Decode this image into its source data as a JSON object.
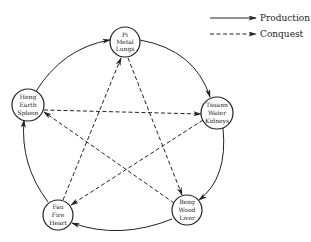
{
  "legend": {
    "production_label": "Production",
    "conquest_label": "Conquest"
  },
  "nodes": [
    {
      "id": "pi",
      "lines": [
        "Pi",
        "Metal",
        "Lungs"
      ],
      "cx": 125,
      "cy": 42
    },
    {
      "id": "tsuann",
      "lines": [
        "Tsuann",
        "Water",
        "Kidneys"
      ],
      "cx": 217,
      "cy": 113
    },
    {
      "id": "beng",
      "lines": [
        "Beng",
        "Wood",
        "Liver"
      ],
      "cx": 187,
      "cy": 210
    },
    {
      "id": "fau",
      "lines": [
        "Fau",
        "Fire",
        "Heart"
      ],
      "cx": 58,
      "cy": 215
    },
    {
      "id": "heng",
      "lines": [
        "Heng",
        "Earth",
        "Spleen"
      ],
      "cx": 28,
      "cy": 105
    }
  ],
  "production_cycle": [
    "heng→pi",
    "pi→tsuann",
    "tsuann→beng",
    "beng→fau",
    "fau→heng"
  ],
  "conquest_cycle": [
    "pi→beng",
    "beng→heng",
    "heng→tsuann",
    "tsuann→fau",
    "fau→pi"
  ]
}
